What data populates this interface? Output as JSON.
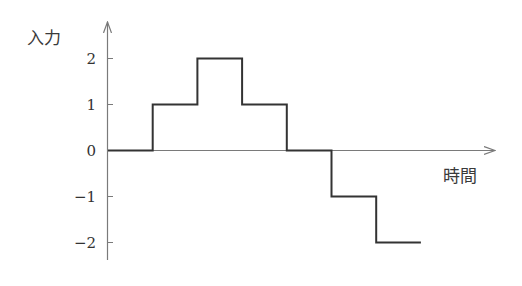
{
  "chart_data": {
    "type": "line",
    "subtype": "step",
    "title": "",
    "xlabel": "時間",
    "ylabel": "入力",
    "yticks": [
      2,
      1,
      0,
      -1,
      -2
    ],
    "ytick_labels": [
      "2",
      "1",
      "0",
      "−1",
      "−2"
    ],
    "ylim": [
      -2.4,
      2.8
    ],
    "grid": false,
    "legend": null,
    "series": [
      {
        "name": "入力",
        "x": [
          0,
          1,
          1,
          2,
          2,
          3,
          3,
          4,
          4,
          5,
          5,
          6,
          6,
          7
        ],
        "y": [
          0,
          0,
          1,
          1,
          2,
          2,
          1,
          1,
          0,
          0,
          -1,
          -1,
          -2,
          -2
        ],
        "steps": [
          {
            "t_start": 0,
            "t_end": 1,
            "value": 0
          },
          {
            "t_start": 1,
            "t_end": 2,
            "value": 1
          },
          {
            "t_start": 2,
            "t_end": 3,
            "value": 2
          },
          {
            "t_start": 3,
            "t_end": 4,
            "value": 1
          },
          {
            "t_start": 4,
            "t_end": 5,
            "value": 0
          },
          {
            "t_start": 5,
            "t_end": 6,
            "value": -1
          },
          {
            "t_start": 6,
            "t_end": 7,
            "value": -2
          }
        ]
      }
    ],
    "colors": {
      "axis": "#7a7a7a",
      "signal": "#333333"
    }
  },
  "labels": {
    "y_axis": "入力",
    "x_axis": "時間",
    "ticks": [
      "2",
      "1",
      "0",
      "−1",
      "−2"
    ]
  }
}
